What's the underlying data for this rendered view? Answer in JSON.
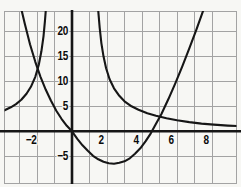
{
  "chart_data": {
    "type": "line",
    "title": "",
    "xlabel": "",
    "ylabel": "",
    "grid": true,
    "legend": false,
    "x_axis": {
      "min": -3.9,
      "max": 9.7,
      "units_per_gridline": 1,
      "gridlines": [
        -3,
        -2,
        -1,
        1,
        2,
        3,
        4,
        5,
        6,
        7,
        8
      ],
      "ticks": [
        {
          "label": "−2",
          "value": -2
        },
        {
          "label": "2",
          "value": 2
        },
        {
          "label": "4",
          "value": 4
        },
        {
          "label": "6",
          "value": 6
        },
        {
          "label": "8",
          "value": 8
        }
      ]
    },
    "y_axis": {
      "min": -10.5,
      "max": 24.5,
      "units_per_gridline": 5,
      "gridlines": [
        20,
        15,
        10,
        5,
        -5
      ],
      "ticks": [
        {
          "label": "20",
          "value": 20
        },
        {
          "label": "15",
          "value": 15
        },
        {
          "label": "10",
          "value": 10
        },
        {
          "label": "5",
          "value": 5
        },
        {
          "label": "−5",
          "value": -5
        }
      ]
    },
    "series": [
      {
        "name": "parabola",
        "description": "U-shaped curve descending from upper left through the origin, minimum near (2.4, -6.5), x-intercepts near 0 and 4.6, rising off the top right",
        "points": [
          [
            -3,
            26
          ],
          [
            -2.7,
            21.5
          ],
          [
            -2.4,
            17.4
          ],
          [
            -2.1,
            13.9
          ],
          [
            -1.8,
            10.9
          ],
          [
            -1.5,
            8.3
          ],
          [
            -1.2,
            6.1
          ],
          [
            -0.9,
            4.1
          ],
          [
            -0.6,
            2.5
          ],
          [
            -0.3,
            1.1
          ],
          [
            0,
            0
          ],
          [
            0.3,
            -1.5
          ],
          [
            0.6,
            -2.8
          ],
          [
            0.9,
            -3.9
          ],
          [
            1.2,
            -4.9
          ],
          [
            1.5,
            -5.6
          ],
          [
            1.8,
            -6.1
          ],
          [
            2.1,
            -6.4
          ],
          [
            2.4,
            -6.5
          ],
          [
            2.7,
            -6.3
          ],
          [
            3,
            -6
          ],
          [
            3.3,
            -5.4
          ],
          [
            3.6,
            -4.5
          ],
          [
            3.9,
            -3.4
          ],
          [
            4.2,
            -2
          ],
          [
            4.5,
            -0.4
          ],
          [
            4.8,
            1.5
          ],
          [
            5.1,
            3.4
          ],
          [
            5.5,
            6.4
          ],
          [
            5.9,
            9.6
          ],
          [
            6.3,
            13
          ],
          [
            6.7,
            16.6
          ],
          [
            7.1,
            20.3
          ],
          [
            7.5,
            24.2
          ],
          [
            7.8,
            27.2
          ]
        ]
      },
      {
        "name": "hyperbola-left-branch",
        "description": "Branch rising from about (-3.9, 4) toward a vertical asymptote near x = -1.5, exiting the top of the grid",
        "points": [
          [
            -3.85,
            4.2
          ],
          [
            -3.5,
            4.8
          ],
          [
            -3.2,
            5.45
          ],
          [
            -2.9,
            6.3
          ],
          [
            -2.6,
            7.5
          ],
          [
            -2.35,
            8.9
          ],
          [
            -2.1,
            10.9
          ],
          [
            -1.9,
            13.3
          ],
          [
            -1.75,
            16
          ],
          [
            -1.63,
            19
          ],
          [
            -1.54,
            22.2
          ],
          [
            -1.47,
            25.5
          ],
          [
            -1.43,
            27.5
          ]
        ]
      },
      {
        "name": "hyperbola-right-branch",
        "description": "Branch falling steeply from the top near x = 1.5 and flattening toward the x-axis, about y = 1 at the right edge",
        "points": [
          [
            1.45,
            27
          ],
          [
            1.5,
            24
          ],
          [
            1.58,
            20.7
          ],
          [
            1.68,
            17.6
          ],
          [
            1.8,
            15
          ],
          [
            1.95,
            12.6
          ],
          [
            2.15,
            10.4
          ],
          [
            2.4,
            8.6
          ],
          [
            2.7,
            7.1
          ],
          [
            3,
            6
          ],
          [
            3.4,
            5
          ],
          [
            3.8,
            4.3
          ],
          [
            4.3,
            3.6
          ],
          [
            4.8,
            3.1
          ],
          [
            5.4,
            2.6
          ],
          [
            6,
            2.2
          ],
          [
            6.7,
            1.85
          ],
          [
            7.4,
            1.55
          ],
          [
            8.1,
            1.35
          ],
          [
            8.9,
            1.15
          ],
          [
            9.7,
            1
          ]
        ]
      }
    ]
  },
  "style": {
    "background": "#f7f7f4",
    "grid_color": "#a3a3a3",
    "curve_color": "#161616",
    "axis_color": "#161616",
    "label_color": "#0a0a0a"
  }
}
